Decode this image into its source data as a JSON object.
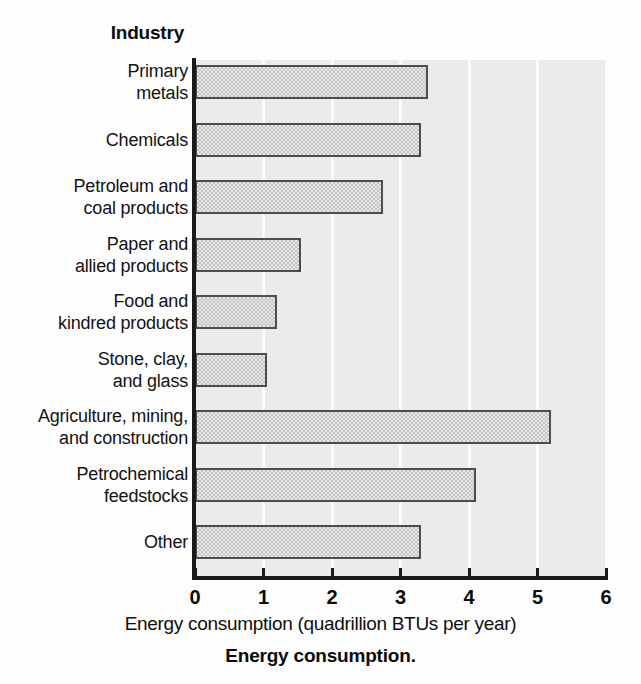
{
  "figure": {
    "caption": "Energy consumption.",
    "category_axis_title": "Industry",
    "value_axis_label": "Energy consumption (quadrillion BTUs per year)"
  },
  "chart_data": {
    "type": "bar",
    "orientation": "horizontal",
    "title": "Energy consumption.",
    "xlabel": "Energy consumption (quadrillion BTUs per year)",
    "ylabel": "Industry",
    "xlim": [
      0,
      6
    ],
    "xticks": [
      "0",
      "1",
      "2",
      "3",
      "4",
      "5",
      "6"
    ],
    "grid": "vertical",
    "legend": "none",
    "units": "quadrillion BTUs per year",
    "categories": [
      "Primary metals",
      "Chemicals",
      "Petroleum and coal products",
      "Paper and allied products",
      "Food and kindred products",
      "Stone, clay, and glass",
      "Agriculture, mining, and construction",
      "Petrochemical feedstocks",
      "Other"
    ],
    "values": [
      3.4,
      3.3,
      2.75,
      1.55,
      1.2,
      1.05,
      5.2,
      4.1,
      3.3
    ],
    "bars": [
      {
        "label_lines": [
          "Primary",
          "metals"
        ],
        "value": 3.4
      },
      {
        "label_lines": [
          "Chemicals"
        ],
        "value": 3.3
      },
      {
        "label_lines": [
          "Petroleum and",
          "coal products"
        ],
        "value": 2.75
      },
      {
        "label_lines": [
          "Paper and",
          "allied products"
        ],
        "value": 1.55
      },
      {
        "label_lines": [
          "Food and",
          "kindred products"
        ],
        "value": 1.2
      },
      {
        "label_lines": [
          "Stone, clay,",
          "and glass"
        ],
        "value": 1.05
      },
      {
        "label_lines": [
          "Agriculture, mining,",
          "and construction"
        ],
        "value": 5.2
      },
      {
        "label_lines": [
          "Petrochemical",
          "feedstocks"
        ],
        "value": 4.1
      },
      {
        "label_lines": [
          "Other"
        ],
        "value": 3.3
      }
    ],
    "colors": {
      "bar_fill": "#c6c6c6",
      "bar_edge": "#4d4d4d",
      "plot_background": "#ebebeb",
      "gridline": "#fbfbfb",
      "axis": "#1a1a1a",
      "text": "#111111"
    }
  }
}
